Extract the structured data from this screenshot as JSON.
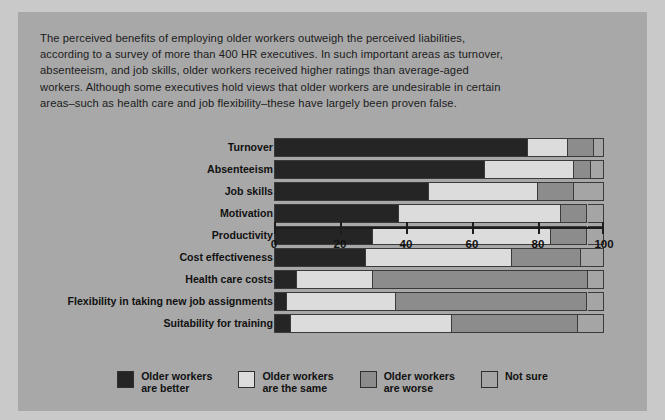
{
  "intro": {
    "text": "The perceived benefits of employing older workers outweigh the perceived liabilities, according to a survey of more than 400 HR executives. In such important areas as turnover, absenteeism, and job skills, older workers received higher ratings than average-aged workers. Although some executives hold views that older workers are undesirable in certain areas–such as health care and job flexibility–these have largely been proven false."
  },
  "chart_data": {
    "type": "bar",
    "orientation": "horizontal",
    "stacked": true,
    "percent": true,
    "title": "",
    "xlabel": "",
    "ylabel": "",
    "xlim": [
      0,
      100
    ],
    "xticks": [
      0,
      20,
      40,
      60,
      80,
      100
    ],
    "xtick_labels": [
      "0",
      "20",
      "40",
      "60",
      "80",
      "100"
    ],
    "grid": false,
    "legend_position": "bottom",
    "categories": [
      "Turnover",
      "Absenteeism",
      "Job skills",
      "Motivation",
      "Productivity",
      "Cost effectiveness",
      "Health care costs",
      "Flexibility in taking new job assignments",
      "Suitability for training"
    ],
    "series": [
      {
        "name": "Older workers are better",
        "color": "#252525",
        "values": [
          77,
          64,
          47,
          38,
          30,
          28,
          7,
          4,
          5
        ]
      },
      {
        "name": "Older workers are the same",
        "color": "#dcdcdc",
        "values": [
          12,
          27,
          33,
          49,
          54,
          44,
          23,
          33,
          49
        ]
      },
      {
        "name": "Older workers are worse",
        "color": "#8c8c8c",
        "values": [
          8,
          5,
          11,
          8,
          11,
          21,
          65,
          58,
          38
        ]
      },
      {
        "name": "Not sure",
        "color": "#a5a5a5",
        "values": [
          3,
          4,
          9,
          5,
          5,
          7,
          5,
          5,
          8
        ]
      }
    ]
  },
  "legend": {
    "items": [
      {
        "label": "Older workers\nare better",
        "color": "#252525"
      },
      {
        "label": "Older workers\nare the same",
        "color": "#dcdcdc"
      },
      {
        "label": "Older workers\nare worse",
        "color": "#8c8c8c"
      },
      {
        "label": "Not sure",
        "color": "#a5a5a5"
      }
    ]
  },
  "colors": {
    "page_background": "#c9c9c9",
    "panel_background": "#a8a8a8",
    "text": "#1b1b1b",
    "axis": "#1c1c1c"
  }
}
